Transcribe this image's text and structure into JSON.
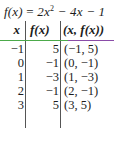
{
  "function": {
    "lhs": "f(x)",
    "eq": "=",
    "rhs_a": "2x",
    "rhs_exp": "2",
    "rhs_b": " − 4x − 1"
  },
  "table": {
    "headers": [
      "x",
      "f(x)",
      "(x, f(x))"
    ],
    "rows": [
      {
        "x": "−1",
        "fx": "5",
        "point": "(−1, 5)"
      },
      {
        "x": "0",
        "fx": "−1",
        "point": "(0, −1)"
      },
      {
        "x": "1",
        "fx": "−3",
        "point": "(1, −3)"
      },
      {
        "x": "2",
        "fx": "−1",
        "point": "(2, −1)"
      },
      {
        "x": "3",
        "fx": "5",
        "point": "(3, 5)"
      }
    ]
  },
  "colors": {
    "header_rule_left": "#4caa4a",
    "header_rule_right": "#8a4ca8"
  }
}
